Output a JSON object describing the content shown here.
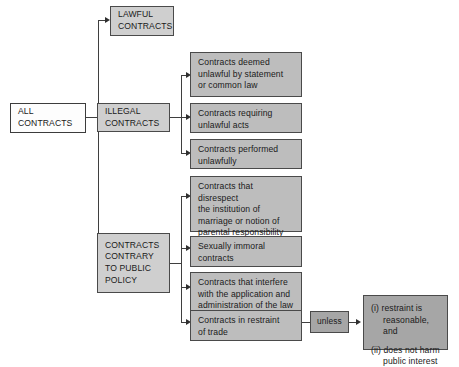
{
  "diagram": {
    "nodes": {
      "all_contracts": "ALL\nCONTRACTS",
      "lawful_contracts": "LAWFUL\nCONTRACTS",
      "illegal_contracts": "ILLEGAL\nCONTRACTS",
      "public_policy": "CONTRACTS\nCONTRARY\nTO PUBLIC\nPOLICY",
      "illegal_1": "Contracts deemed\nunlawful by statement\nor common law",
      "illegal_2": "Contracts requiring\nunlawful acts",
      "illegal_3": "Contracts performed\nunlawfully",
      "policy_1": "Contracts that disrespect\nthe institution of\nmarriage or notion of\nparental responsibility",
      "policy_2": "Sexually immoral\ncontracts",
      "policy_3": "Contracts that interfere\nwith the application and\nadministration of the law",
      "policy_4": "Contracts in restraint\nof trade",
      "unless": "unless",
      "exception_1": "(i) restraint is\n      reasonable, and",
      "exception_2": "(ii) does not harm\n      public interest"
    },
    "colors": {
      "box_fill": "#b6b6b6",
      "box_fill_light": "#cfcfcf",
      "box_fill_dark": "#a6a6a6",
      "box_fill_white": "#fdfdfd",
      "border": "#4a4a4a",
      "connector": "#3f3f3f",
      "text": "#1a1a1a",
      "background": "#ffffff"
    }
  }
}
